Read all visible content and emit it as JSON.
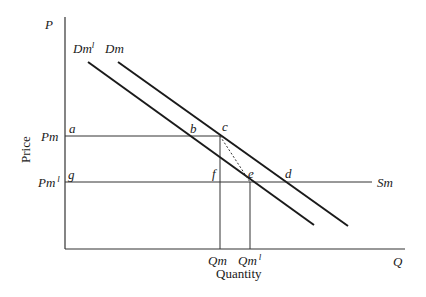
{
  "diagram": {
    "axes": {
      "y_axis_symbol": "P",
      "x_axis_symbol": "Q",
      "y_axis_title": "Price",
      "x_axis_title": "Quantity"
    },
    "curves": {
      "demand_shifted": {
        "label": "Dm",
        "sup": "l"
      },
      "demand": {
        "label": "Dm"
      },
      "supply": {
        "label": "Sm"
      }
    },
    "price_levels": {
      "pm": {
        "label": "Pm"
      },
      "pm1": {
        "label": "Pm",
        "sup": "l"
      }
    },
    "quantity_levels": {
      "qm": {
        "label": "Qm"
      },
      "qm1": {
        "label": "Qm",
        "sup": "l"
      }
    },
    "points": {
      "a": "a",
      "b": "b",
      "c": "c",
      "d": "d",
      "e": "e",
      "f": "f",
      "g": "g"
    },
    "colors": {
      "ink": "#1a1a1a",
      "line": "#333333"
    }
  }
}
